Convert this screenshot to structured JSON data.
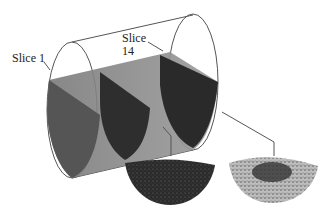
{
  "figure": {
    "type": "rotating-drum-slices-diagram",
    "labels": {
      "slice1": "Slice 1",
      "slice14_line1": "Slice",
      "slice14_line2": "14"
    },
    "insets": [
      {
        "name": "slice-1-cross-section",
        "appearance": "uniform dark particles"
      },
      {
        "name": "slice-14-cross-section",
        "appearance": "segregated: dark core, light periphery"
      }
    ],
    "colors": {
      "outline": "#555555",
      "dark_bed": "#2a2a2a",
      "mid_bed": "#6a6a6a",
      "light_particles": "#cfcfcf"
    }
  }
}
